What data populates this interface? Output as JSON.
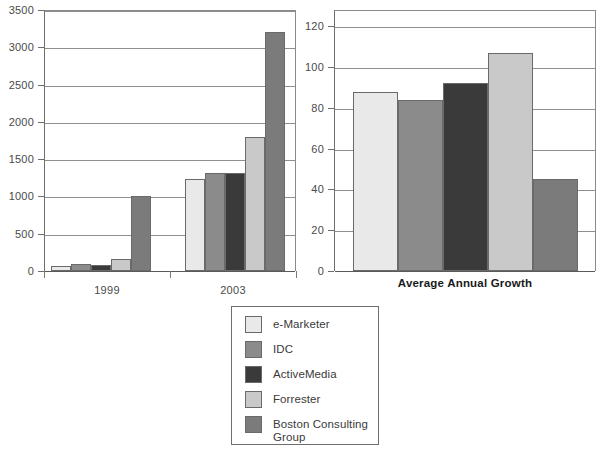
{
  "chart_data": [
    {
      "type": "bar",
      "id": "revenue-chart",
      "title": "",
      "xlabel": "",
      "ylabel": "",
      "categories": [
        "1999",
        "2003"
      ],
      "ylim": [
        0,
        3500
      ],
      "yticks": [
        0,
        500,
        1000,
        1500,
        2000,
        2500,
        3000,
        3500
      ],
      "ytick_labels": [
        "0",
        "500",
        "1000",
        "1500",
        "2000",
        "2500",
        "3000",
        "3500"
      ],
      "grid": true,
      "legend_position": "below-center",
      "series": [
        {
          "name": "e-Marketer",
          "color": "#e9e9e9",
          "values": [
            70,
            1230
          ]
        },
        {
          "name": "IDC",
          "color": "#8b8b8b",
          "values": [
            90,
            1310
          ]
        },
        {
          "name": "ActiveMedia",
          "color": "#3a3a3a",
          "values": [
            80,
            1310
          ]
        },
        {
          "name": "Forrester",
          "color": "#c9c9c9",
          "values": [
            160,
            1800
          ]
        },
        {
          "name": "Boston Consulting Group",
          "color": "#7b7b7b",
          "values": [
            1000,
            3200
          ]
        }
      ]
    },
    {
      "type": "bar",
      "id": "growth-chart",
      "title": "",
      "xlabel": "Average Annual Growth",
      "ylabel": "",
      "categories": [
        "Average Annual Growth"
      ],
      "ylim": [
        0,
        128
      ],
      "yticks": [
        0,
        20,
        40,
        60,
        80,
        100,
        120
      ],
      "ytick_labels": [
        "0",
        "20",
        "40",
        "60",
        "80",
        "100",
        "120"
      ],
      "grid": true,
      "legend_position": "shared",
      "series": [
        {
          "name": "e-Marketer",
          "color": "#e9e9e9",
          "values": [
            88
          ]
        },
        {
          "name": "IDC",
          "color": "#8b8b8b",
          "values": [
            84
          ]
        },
        {
          "name": "ActiveMedia",
          "color": "#3a3a3a",
          "values": [
            92
          ]
        },
        {
          "name": "Forrester",
          "color": "#c9c9c9",
          "values": [
            107
          ]
        },
        {
          "name": "Boston Consulting Group",
          "color": "#7b7b7b",
          "values": [
            45
          ]
        }
      ]
    }
  ],
  "legend": {
    "items": [
      {
        "label": "e-Marketer",
        "color": "#e9e9e9"
      },
      {
        "label": "IDC",
        "color": "#8b8b8b"
      },
      {
        "label": "ActiveMedia",
        "color": "#3a3a3a"
      },
      {
        "label": "Forrester",
        "color": "#c9c9c9"
      },
      {
        "label": "Boston Consulting\nGroup",
        "color": "#7b7b7b"
      }
    ]
  },
  "colors": {
    "axis": "#6e6e6e",
    "grid": "#8f8f8f",
    "text": "#4a4a4a",
    "title_text": "#1a1a1a",
    "background": "#ffffff"
  }
}
